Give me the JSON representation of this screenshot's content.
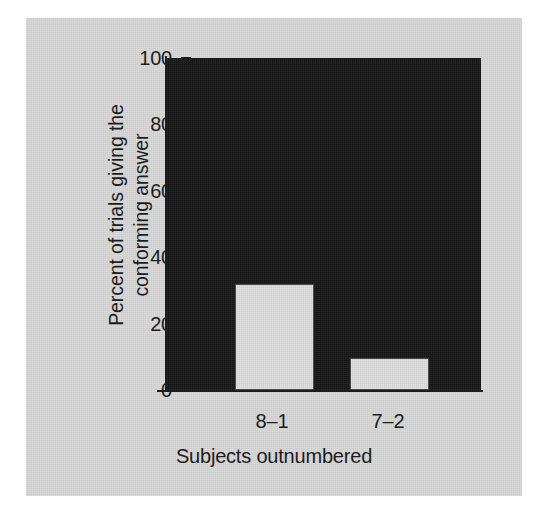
{
  "chart_data": {
    "type": "bar",
    "title": "",
    "subtitle": "",
    "categories": [
      "8–1",
      "7–2"
    ],
    "values": [
      32,
      9.5
    ],
    "series": [
      {
        "name": "Percent of trials giving the conforming answer",
        "values": [
          32,
          9.5
        ]
      }
    ],
    "xlabel": "Subjects outnumbered",
    "ylabel": "Percent of trials giving the\nconforming answer",
    "ylabel_lines": [
      "Percent of trials giving the",
      "conforming answer"
    ],
    "ylim": [
      0,
      100
    ],
    "yticks": [
      0,
      20,
      40,
      60,
      80,
      100
    ],
    "ytick_labels": [
      "0",
      "20",
      "40",
      "60",
      "80",
      "100"
    ],
    "grid": false,
    "legend": false,
    "legend_position": "none",
    "annotations": [],
    "colors": {
      "bar_fill": "#d9d9d9",
      "bar_edge": "#4a4a4a",
      "plot_background": "#171717",
      "figure_background": "#d5d5d5",
      "page_background": "#ffffff",
      "axis": "#1c1c1c",
      "text": "#1c1c1c"
    }
  },
  "axes": {
    "y_title_line_1": "Percent of trials giving the",
    "y_title_line_2": "conforming answer",
    "x_title": "Subjects outnumbered",
    "y_ticks": [
      {
        "label": "100",
        "value": 100
      },
      {
        "label": "80",
        "value": 80
      },
      {
        "label": "60",
        "value": 60
      },
      {
        "label": "40",
        "value": 40
      },
      {
        "label": "20",
        "value": 20
      },
      {
        "label": "0",
        "value": 0
      }
    ],
    "x_ticks": [
      {
        "label": "8–1",
        "value": 32
      },
      {
        "label": "7–2",
        "value": 9.5
      }
    ]
  }
}
